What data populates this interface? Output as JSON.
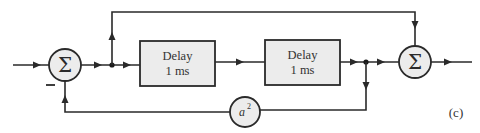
{
  "diagram": {
    "label": "(c)",
    "summers": [
      {
        "id": "sum1",
        "symbol": "Σ",
        "minus_sign": "—"
      },
      {
        "id": "sum2",
        "symbol": "Σ"
      }
    ],
    "blocks": [
      {
        "id": "delay1",
        "line1": "Delay",
        "line2": "1 ms"
      },
      {
        "id": "delay2",
        "line1": "Delay",
        "line2": "1 ms"
      }
    ],
    "gain": {
      "id": "gain",
      "base": "a",
      "exponent": "2"
    },
    "colors": {
      "line": "#2a2a2a",
      "fill": "#ececec",
      "background": "#ffffff"
    }
  }
}
